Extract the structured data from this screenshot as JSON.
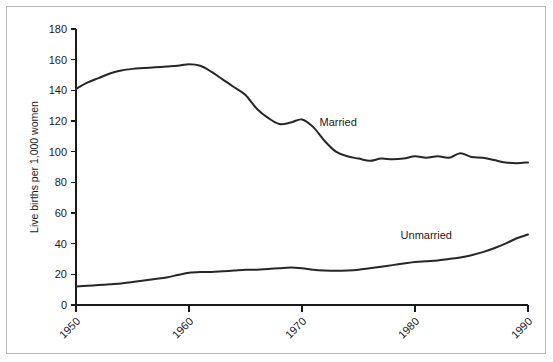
{
  "chart_data": {
    "type": "line",
    "title": "",
    "subtitle": "",
    "xlabel": "",
    "ylabel": "Live births per 1,000 women",
    "xlim": [
      1950,
      1990
    ],
    "ylim": [
      0,
      180
    ],
    "grid": false,
    "legend_position": "inline-annotation",
    "x_ticks": [
      "1950",
      "1960",
      "1970",
      "1980",
      "1990"
    ],
    "x_tick_values": [
      1950,
      1960,
      1970,
      1980,
      1990
    ],
    "y_ticks": [
      "0",
      "20",
      "40",
      "60",
      "80",
      "100",
      "120",
      "140",
      "160",
      "180"
    ],
    "y_tick_values": [
      0,
      20,
      40,
      60,
      80,
      100,
      120,
      140,
      160,
      180
    ],
    "x_tick_rotation": -45,
    "line_color": "#262626",
    "x": [
      1950,
      1951,
      1952,
      1953,
      1954,
      1955,
      1956,
      1957,
      1958,
      1959,
      1960,
      1961,
      1962,
      1963,
      1964,
      1965,
      1966,
      1967,
      1968,
      1969,
      1970,
      1971,
      1972,
      1973,
      1974,
      1975,
      1976,
      1977,
      1978,
      1979,
      1980,
      1981,
      1982,
      1983,
      1984,
      1985,
      1986,
      1987,
      1988,
      1989,
      1990
    ],
    "series": [
      {
        "name": "Married",
        "label": "Married",
        "label_x": 1973.2,
        "label_y": 117,
        "values": [
          141,
          145,
          148,
          151,
          153,
          154,
          154.5,
          155,
          155.5,
          156,
          157,
          156,
          152,
          147,
          142,
          137,
          128,
          122,
          118,
          119,
          121,
          116,
          107,
          100,
          97,
          95.5,
          94,
          95.5,
          95,
          95.5,
          97,
          96,
          97,
          96,
          99,
          96.5,
          96,
          94.5,
          93,
          92.5,
          93
        ]
      },
      {
        "name": "Unmarried",
        "label": "Unmarried",
        "label_x": 1981.0,
        "label_y": 43,
        "values": [
          12,
          12.5,
          13,
          13.5,
          14,
          15,
          16,
          17,
          18,
          19.5,
          21,
          21.5,
          21.5,
          22,
          22.5,
          23,
          23,
          23.5,
          24,
          24.5,
          24,
          23,
          22.5,
          22.3,
          22.5,
          23,
          24,
          25,
          26,
          27,
          28,
          28.5,
          29,
          30,
          31,
          32.5,
          34.5,
          37,
          40,
          43.5,
          46
        ]
      }
    ]
  },
  "figure": {
    "background_color": "#ffffff",
    "border_color": "#b9b9b9"
  }
}
